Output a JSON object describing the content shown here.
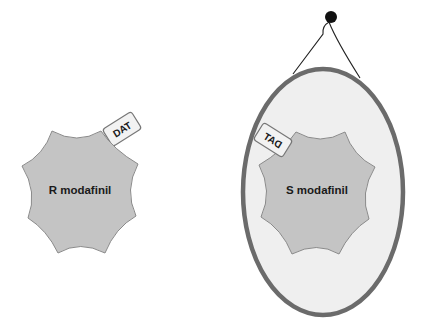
{
  "left_molecule": {
    "label": "R modafinil",
    "tag": "DAT",
    "fill": "#c4c4c4",
    "stroke": "#8a8a8a"
  },
  "right_molecule": {
    "label": "S modafinil",
    "tag": "DAT",
    "tag_mirrored": true,
    "fill": "#c4c4c4",
    "stroke": "#8a8a8a"
  },
  "mirror": {
    "frame_color": "#6b6b6b",
    "glass_color": "#efefef",
    "hook_color": "#111111"
  }
}
